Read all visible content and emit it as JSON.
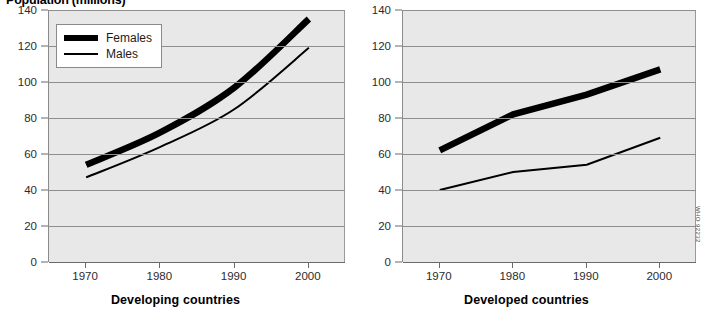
{
  "title": "Population (millions)",
  "credit": "WHO 92232",
  "legend": {
    "items": [
      {
        "label": "Females",
        "style": "thick",
        "color": "#000000"
      },
      {
        "label": "Males",
        "style": "thin",
        "color": "#000000"
      }
    ]
  },
  "colors": {
    "plot_background": "#e8e8e8",
    "gridline": "#8e8e8e",
    "axis": "#6a6a6a",
    "series": "#000000",
    "page_background": "#ffffff"
  },
  "axes": {
    "y_ticks": [
      "0",
      "20",
      "40",
      "60",
      "80",
      "100",
      "120",
      "140"
    ],
    "x_ticks": [
      "1970",
      "1980",
      "1990",
      "2000"
    ],
    "ylim": [
      0,
      140
    ],
    "xlim": [
      1965,
      2005
    ]
  },
  "panels": [
    {
      "caption": "Developing countries"
    },
    {
      "caption": "Developed countries"
    }
  ],
  "chart_data": [
    {
      "type": "line",
      "title": "Population (millions)",
      "subtitle": "Developing countries",
      "xlabel": "",
      "ylabel": "Population (millions)",
      "x": [
        1970,
        1980,
        1990,
        2000
      ],
      "xlim": [
        1965,
        2005
      ],
      "ylim": [
        0,
        140
      ],
      "grid": true,
      "legend_position": "top-left",
      "series": [
        {
          "name": "Females",
          "values": [
            54,
            72,
            97,
            135
          ],
          "linewidth": "thick"
        },
        {
          "name": "Males",
          "values": [
            47,
            64,
            85,
            119
          ],
          "linewidth": "thin"
        }
      ]
    },
    {
      "type": "line",
      "title": "Population (millions)",
      "subtitle": "Developed countries",
      "xlabel": "",
      "ylabel": "Population (millions)",
      "x": [
        1970,
        1980,
        1990,
        2000
      ],
      "xlim": [
        1965,
        2005
      ],
      "ylim": [
        0,
        140
      ],
      "grid": true,
      "legend_position": "none",
      "series": [
        {
          "name": "Females",
          "values": [
            62,
            82,
            93,
            107
          ],
          "linewidth": "thick"
        },
        {
          "name": "Males",
          "values": [
            40,
            50,
            54,
            69
          ],
          "linewidth": "thin"
        }
      ]
    }
  ]
}
